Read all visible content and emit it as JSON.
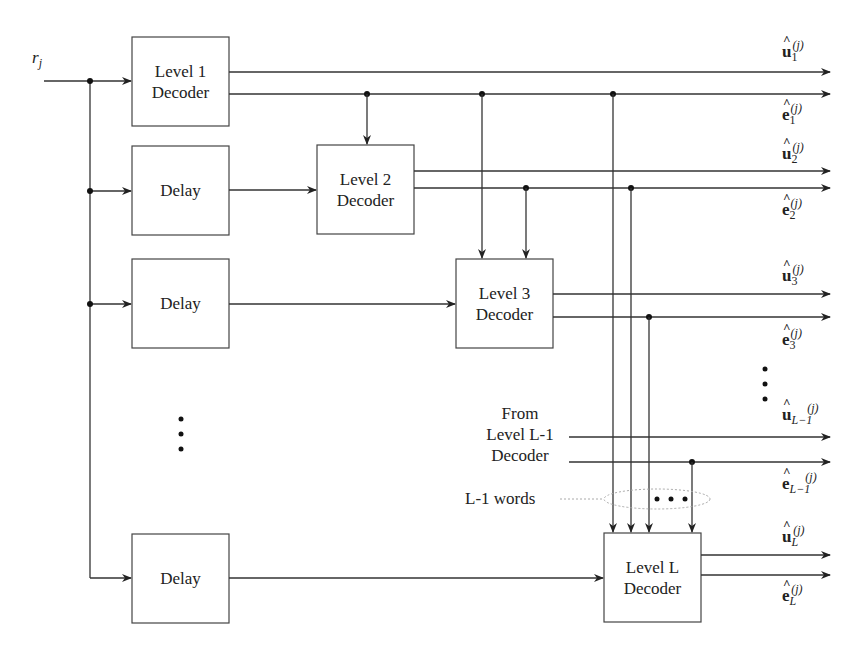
{
  "diagram": {
    "type": "block-diagram",
    "title": "",
    "input": {
      "label": "r",
      "subscript": "j"
    },
    "blocks": [
      {
        "id": "level1",
        "line1": "Level 1",
        "line2": "Decoder"
      },
      {
        "id": "delay1",
        "line1": "Delay",
        "line2": ""
      },
      {
        "id": "level2",
        "line1": "Level 2",
        "line2": "Decoder"
      },
      {
        "id": "delay2",
        "line1": "Delay",
        "line2": ""
      },
      {
        "id": "level3",
        "line1": "Level 3",
        "line2": "Decoder"
      },
      {
        "id": "delayL",
        "line1": "Delay",
        "line2": ""
      },
      {
        "id": "levelL",
        "line1": "Level L",
        "line2": "Decoder"
      }
    ],
    "outputs": [
      {
        "sym": "u",
        "sub": "1",
        "sup": "(j)"
      },
      {
        "sym": "e",
        "sub": "1",
        "sup": "(j)"
      },
      {
        "sym": "u",
        "sub": "2",
        "sup": "(j)"
      },
      {
        "sym": "e",
        "sub": "2",
        "sup": "(j)"
      },
      {
        "sym": "u",
        "sub": "3",
        "sup": "(j)"
      },
      {
        "sym": "e",
        "sub": "3",
        "sup": "(j)"
      },
      {
        "sym": "u",
        "sub": "L−1",
        "sup": "(j)"
      },
      {
        "sym": "e",
        "sub": "L−1",
        "sup": "(j)"
      },
      {
        "sym": "u",
        "sub": "L",
        "sup": "(j)"
      },
      {
        "sym": "e",
        "sub": "L",
        "sup": "(j)"
      }
    ],
    "annotations": {
      "from_line1": "From",
      "from_line2": "Level L-1",
      "from_line3": "Decoder",
      "words_label": "L-1 words",
      "ellipsis": "• • •"
    }
  }
}
